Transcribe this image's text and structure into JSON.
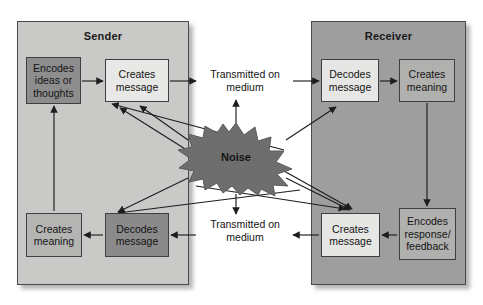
{
  "diagram": {
    "panels": [
      {
        "id": "sender",
        "label": "Sender",
        "color": "#c9c9c7"
      },
      {
        "id": "receiver",
        "label": "Receiver",
        "color": "#9e9e9e"
      }
    ],
    "boxes": [
      {
        "id": "encode-ideas",
        "label": "Encodes ideas or thoughts",
        "panel": "sender",
        "fill": "#8d8d8d"
      },
      {
        "id": "creates-message-1",
        "label": "Creates message",
        "panel": "sender",
        "fill": "#e8e8e6"
      },
      {
        "id": "creates-meaning-1",
        "label": "Creates meaning",
        "panel": "sender",
        "fill": "#b4b4b2"
      },
      {
        "id": "decodes-message-2",
        "label": "Decodes message",
        "panel": "sender",
        "fill": "#8a8a8a"
      },
      {
        "id": "decodes-message-1",
        "label": "Decodes message",
        "panel": "receiver",
        "fill": "#e6e6e4"
      },
      {
        "id": "creates-meaning-2",
        "label": "Creates meaning",
        "panel": "receiver",
        "fill": "#b0b0ae"
      },
      {
        "id": "creates-message-2",
        "label": "Creates message",
        "panel": "receiver",
        "fill": "#e6e6e4"
      },
      {
        "id": "encodes-response",
        "label": "Encodes response/ feedback",
        "panel": "receiver",
        "fill": "#b0b0ae"
      }
    ],
    "medium_labels": [
      {
        "id": "transmitted-top",
        "label": "Transmitted on medium"
      },
      {
        "id": "transmitted-bottom",
        "label": "Transmitted on medium"
      }
    ],
    "noise": {
      "label": "Noise",
      "fill": "#6e6e6e"
    }
  }
}
